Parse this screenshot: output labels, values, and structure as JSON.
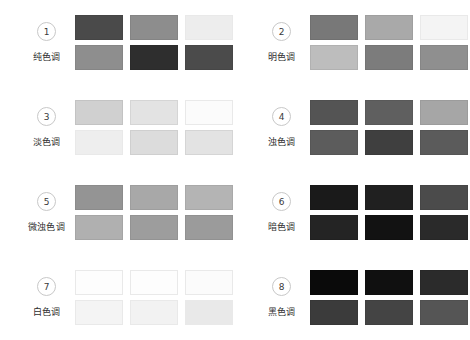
{
  "page": {
    "background": "#ffffff",
    "columns": 2,
    "rows": 4
  },
  "groups": [
    {
      "number": "1",
      "label": "纯色调",
      "swatches": [
        "#4a4a4a",
        "#8d8d8d",
        "#ededed",
        "#8e8e8e",
        "#2e2e2e",
        "#4b4b4b"
      ]
    },
    {
      "number": "2",
      "label": "明色调",
      "swatches": [
        "#787878",
        "#a9a9a9",
        "#f4f4f4",
        "#bdbdbd",
        "#7c7c7c",
        "#8f8f8f"
      ]
    },
    {
      "number": "3",
      "label": "淡色调",
      "swatches": [
        "#d0d0d0",
        "#e3e3e3",
        "#fbfbfb",
        "#eeeeee",
        "#dcdcdc",
        "#e3e3e3"
      ]
    },
    {
      "number": "4",
      "label": "浊色调",
      "swatches": [
        "#545454",
        "#5f5f5f",
        "#a6a6a6",
        "#5c5c5c",
        "#3f3f3f",
        "#5b5b5b"
      ]
    },
    {
      "number": "5",
      "label": "微浊色调",
      "swatches": [
        "#949494",
        "#a8a8a8",
        "#b4b4b4",
        "#b0b0b0",
        "#9d9d9d",
        "#9b9b9b"
      ]
    },
    {
      "number": "6",
      "label": "暗色调",
      "swatches": [
        "#1a1a1a",
        "#202020",
        "#4b4b4b",
        "#242424",
        "#121212",
        "#2a2a2a"
      ]
    },
    {
      "number": "7",
      "label": "白色调",
      "swatches": [
        "#fdfdfd",
        "#fdfdfd",
        "#fbfbfb",
        "#f4f4f4",
        "#f2f2f2",
        "#e9e9e9"
      ]
    },
    {
      "number": "8",
      "label": "黑色调",
      "swatches": [
        "#0a0a0a",
        "#101010",
        "#2b2b2b",
        "#3b3b3b",
        "#444444",
        "#555555"
      ]
    }
  ]
}
